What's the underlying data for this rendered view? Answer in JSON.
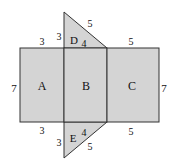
{
  "figure": {
    "fill_color": "#d4d4d4",
    "stroke_color": "#333333",
    "faces": {
      "A": "A",
      "B": "B",
      "C": "C",
      "D": "D",
      "E": "E"
    },
    "dimensions": {
      "left_height": "7",
      "right_height": "7",
      "a_top_width": "3",
      "a_bottom_width": "3",
      "c_top_width": "5",
      "c_bottom_width": "5",
      "d_leg_vertical": "3",
      "d_leg_horizontal": "4",
      "d_hypotenuse": "5",
      "e_leg_vertical": "3",
      "e_leg_horizontal": "4",
      "e_hypotenuse": "5"
    }
  }
}
